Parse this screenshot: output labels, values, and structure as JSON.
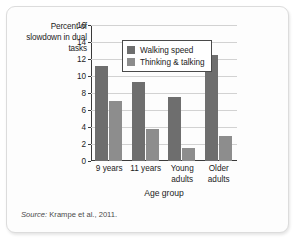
{
  "figure": {
    "y_axis_caption": "Percent of\nslowdown\nin dual tasks",
    "source_prefix": "Source:",
    "source_text": " Krampe et al., 2011."
  },
  "chart_data": {
    "type": "bar",
    "title": "",
    "xlabel": "Age group",
    "ylabel": "Percent of slowdown in dual tasks",
    "categories": [
      "9 years",
      "11 years",
      "Young\nadults",
      "Older\nadults"
    ],
    "series": [
      {
        "name": "Walking speed",
        "color": "#6e6e6e",
        "values": [
          11.2,
          9.3,
          7.5,
          12.5
        ]
      },
      {
        "name": "Thinking & talking",
        "color": "#8d8d8d",
        "values": [
          7.1,
          3.8,
          1.5,
          2.9
        ]
      }
    ],
    "ylim": [
      0,
      16
    ],
    "yticks": [
      0,
      2,
      4,
      6,
      8,
      10,
      12,
      14,
      16
    ],
    "grid": true,
    "legend_position": "upper-center"
  }
}
